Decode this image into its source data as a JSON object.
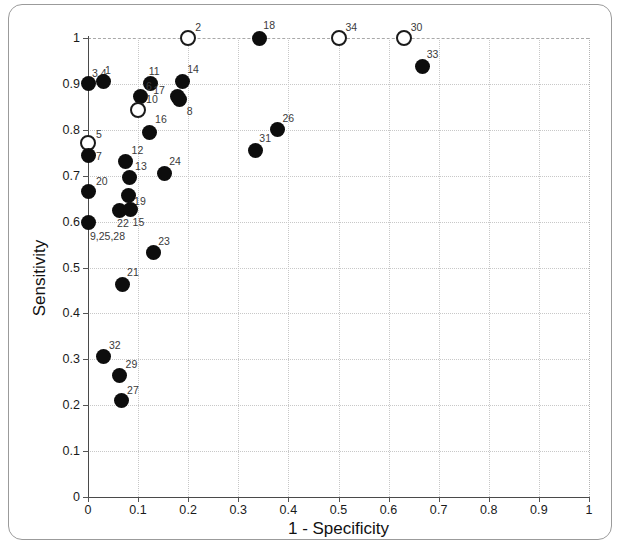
{
  "figure": {
    "frame": "rounded-panel"
  },
  "axes": {
    "x": {
      "label": "1 - Specificity",
      "min": 0,
      "max": 1,
      "ticks": [
        0,
        0.1,
        0.2,
        0.3,
        0.4,
        0.5,
        0.6,
        0.7,
        0.8,
        0.9,
        1
      ],
      "tick_labels": [
        "0",
        "0.1",
        "0.2",
        "0.3",
        "0.4",
        "0.5",
        "0.6",
        "0.7",
        "0.8",
        "0.9",
        "1"
      ]
    },
    "y": {
      "label": "Sensitivity",
      "min": 0,
      "max": 1,
      "ticks": [
        0,
        0.1,
        0.2,
        0.3,
        0.4,
        0.5,
        0.6,
        0.7,
        0.8,
        0.9,
        1
      ],
      "tick_labels": [
        "0",
        "0.1",
        "0.2",
        "0.3",
        "0.4",
        "0.5",
        "0.6",
        "0.7",
        "0.8",
        "0.9",
        "1"
      ]
    }
  },
  "colors": {
    "filled_marker": "#0d0d0d",
    "open_marker_stroke": "#1a1a1a",
    "open_marker_fill": "#ffffff",
    "axis": "#4a4a4a",
    "grid": "#c8c8c8",
    "frame": "#9b9b9b",
    "text": "#1a1a1a",
    "point_label": "#3a3a3a"
  },
  "chart_data": {
    "type": "scatter",
    "title": "",
    "xlabel": "1 - Specificity",
    "ylabel": "Sensitivity",
    "xlim": [
      0,
      1
    ],
    "ylim": [
      0,
      1
    ],
    "grid": true,
    "legend": "none",
    "marker_styles": {
      "filled": "solid black circle",
      "open": "hollow black-outlined circle"
    },
    "points": [
      {
        "label": "3,4",
        "x": 0.0,
        "y": 0.9,
        "style": "filled",
        "label_dx": 4,
        "label_dy": -16
      },
      {
        "label": "1",
        "x": 0.03,
        "y": 0.905,
        "style": "filled",
        "label_dx": 2,
        "label_dy": -17
      },
      {
        "label": "11",
        "x": 0.125,
        "y": 0.9,
        "style": "filled",
        "label_dx": -2,
        "label_dy": -18
      },
      {
        "label": "14",
        "x": 0.188,
        "y": 0.905,
        "style": "filled",
        "label_dx": 5,
        "label_dy": -18
      },
      {
        "label": "17",
        "x": 0.178,
        "y": 0.872,
        "style": "filled",
        "label_dx": -24,
        "label_dy": -12
      },
      {
        "label": "8",
        "x": 0.183,
        "y": 0.866,
        "style": "filled",
        "label_dx": 7,
        "label_dy": 6
      },
      {
        "label": "6",
        "x": 0.104,
        "y": 0.872,
        "style": "filled",
        "label_dx": 6,
        "label_dy": 0
      },
      {
        "label": "10",
        "x": 0.1,
        "y": 0.843,
        "style": "open",
        "label_dx": 8,
        "label_dy": 0
      },
      {
        "label": "16",
        "x": 0.122,
        "y": 0.795,
        "style": "filled",
        "label_dx": 6,
        "label_dy": -18
      },
      {
        "label": "5",
        "x": 0.0,
        "y": 0.772,
        "style": "open",
        "label_dx": 8,
        "label_dy": -14
      },
      {
        "label": "7",
        "x": 0.0,
        "y": 0.745,
        "style": "filled",
        "label_dx": 8,
        "label_dy": -4
      },
      {
        "label": "20",
        "x": 0.0,
        "y": 0.665,
        "style": "filled",
        "label_dx": 8,
        "label_dy": -16
      },
      {
        "label": "9,25,28",
        "x": 0.0,
        "y": 0.598,
        "style": "filled",
        "label_dx": 2,
        "label_dy": 8
      },
      {
        "label": "12",
        "x": 0.075,
        "y": 0.73,
        "style": "filled",
        "label_dx": 6,
        "label_dy": -17
      },
      {
        "label": "13",
        "x": 0.082,
        "y": 0.697,
        "style": "filled",
        "label_dx": 6,
        "label_dy": -16
      },
      {
        "label": "19",
        "x": 0.08,
        "y": 0.657,
        "style": "filled",
        "label_dx": 6,
        "label_dy": 1
      },
      {
        "label": "22",
        "x": 0.062,
        "y": 0.625,
        "style": "filled",
        "label_dx": -2,
        "label_dy": 8
      },
      {
        "label": "15",
        "x": 0.085,
        "y": 0.627,
        "style": "filled",
        "label_dx": 2,
        "label_dy": 8
      },
      {
        "label": "24",
        "x": 0.152,
        "y": 0.705,
        "style": "filled",
        "label_dx": 5,
        "label_dy": -17
      },
      {
        "label": "23",
        "x": 0.13,
        "y": 0.532,
        "style": "filled",
        "label_dx": 5,
        "label_dy": -17
      },
      {
        "label": "21",
        "x": 0.068,
        "y": 0.463,
        "style": "filled",
        "label_dx": 5,
        "label_dy": -17
      },
      {
        "label": "32",
        "x": 0.03,
        "y": 0.307,
        "style": "filled",
        "label_dx": 6,
        "label_dy": -16
      },
      {
        "label": "29",
        "x": 0.063,
        "y": 0.265,
        "style": "filled",
        "label_dx": 6,
        "label_dy": -16
      },
      {
        "label": "27",
        "x": 0.066,
        "y": 0.21,
        "style": "filled",
        "label_dx": 6,
        "label_dy": -16
      },
      {
        "label": "2",
        "x": 0.2,
        "y": 1.0,
        "style": "open",
        "label_dx": 7,
        "label_dy": -16
      },
      {
        "label": "18",
        "x": 0.342,
        "y": 1.0,
        "style": "filled",
        "label_dx": 4,
        "label_dy": -18
      },
      {
        "label": "34",
        "x": 0.5,
        "y": 1.0,
        "style": "open",
        "label_dx": 7,
        "label_dy": -16
      },
      {
        "label": "30",
        "x": 0.63,
        "y": 1.0,
        "style": "open",
        "label_dx": 7,
        "label_dy": -16
      },
      {
        "label": "33",
        "x": 0.668,
        "y": 0.938,
        "style": "filled",
        "label_dx": 4,
        "label_dy": -17
      },
      {
        "label": "26",
        "x": 0.378,
        "y": 0.8,
        "style": "filled",
        "label_dx": 5,
        "label_dy": -17
      },
      {
        "label": "31",
        "x": 0.334,
        "y": 0.755,
        "style": "filled",
        "label_dx": 4,
        "label_dy": -17
      }
    ]
  }
}
